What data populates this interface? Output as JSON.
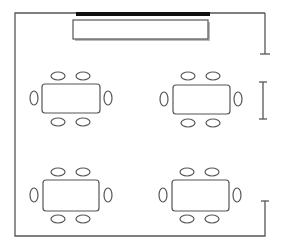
{
  "diagram": {
    "title": "Classroom layout floor plan",
    "colors": {
      "wall": "#555555",
      "furniture": "#555555",
      "board_bar": "#111111",
      "background": "#ffffff"
    },
    "elements": {
      "front_board": "whiteboard-bar",
      "presentation_screen": "screen-rectangle",
      "doors": [
        "door-top-right",
        "door-middle-right",
        "door-bottom-right"
      ],
      "tables": [
        {
          "id": "table-top-left",
          "chairs": 6
        },
        {
          "id": "table-top-right",
          "chairs": 6
        },
        {
          "id": "table-bottom-left",
          "chairs": 6
        },
        {
          "id": "table-bottom-right",
          "chairs": 6
        }
      ]
    }
  }
}
